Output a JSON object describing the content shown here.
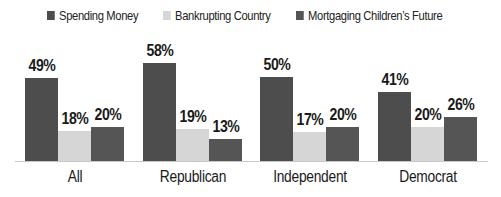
{
  "colors": {
    "spending": "#4d4d4d",
    "bankrupting": "#d6d6d6",
    "mortgaging": "#555555"
  },
  "legend": [
    {
      "label": "Spending Money",
      "color": "#4d4d4d"
    },
    {
      "label": "Bankrupting Country",
      "color": "#d6d6d6"
    },
    {
      "label": "Mortgaging Children’s Future",
      "color": "#555555"
    }
  ],
  "chart_data": {
    "type": "bar",
    "title": "",
    "xlabel": "",
    "ylabel": "",
    "categories": [
      "All",
      "Republican",
      "Independent",
      "Democrat"
    ],
    "series": [
      {
        "name": "Spending Money",
        "values": [
          49,
          58,
          50,
          41
        ]
      },
      {
        "name": "Bankrupting Country",
        "values": [
          18,
          19,
          17,
          20
        ]
      },
      {
        "name": "Mortgaging Children’s Future",
        "values": [
          20,
          13,
          20,
          26
        ]
      }
    ],
    "value_labels": [
      [
        "49%",
        "18%",
        "20%"
      ],
      [
        "58%",
        "19%",
        "13%"
      ],
      [
        "50%",
        "17%",
        "20%"
      ],
      [
        "41%",
        "20%",
        "26%"
      ]
    ],
    "ylim": [
      0,
      60
    ],
    "grid": false,
    "legend_position": "top",
    "unit": "%"
  }
}
